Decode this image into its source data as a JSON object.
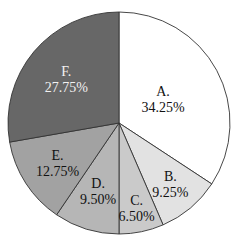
{
  "chart_data": {
    "type": "pie",
    "title": "",
    "start_angle_deg": 90,
    "direction": "clockwise",
    "categories": [
      "A.",
      "B.",
      "C.",
      "D.",
      "E.",
      "F."
    ],
    "values": [
      34.25,
      9.25,
      6.5,
      9.5,
      12.75,
      27.75
    ],
    "labels": [
      "34.25%",
      "9.25%",
      "6.50%",
      "9.50%",
      "12.75%",
      "27.75%"
    ],
    "colors": [
      "#ffffff",
      "#e2e2e2",
      "#cacaca",
      "#b6b6b6",
      "#a2a2a2",
      "#676767"
    ],
    "label_colors": [
      "#111111",
      "#111111",
      "#111111",
      "#111111",
      "#111111",
      "#f2f2f2"
    ],
    "legend": "none",
    "edge_color": "#333333"
  },
  "geometry": {
    "cx": 119,
    "cy": 123,
    "r": 111
  }
}
